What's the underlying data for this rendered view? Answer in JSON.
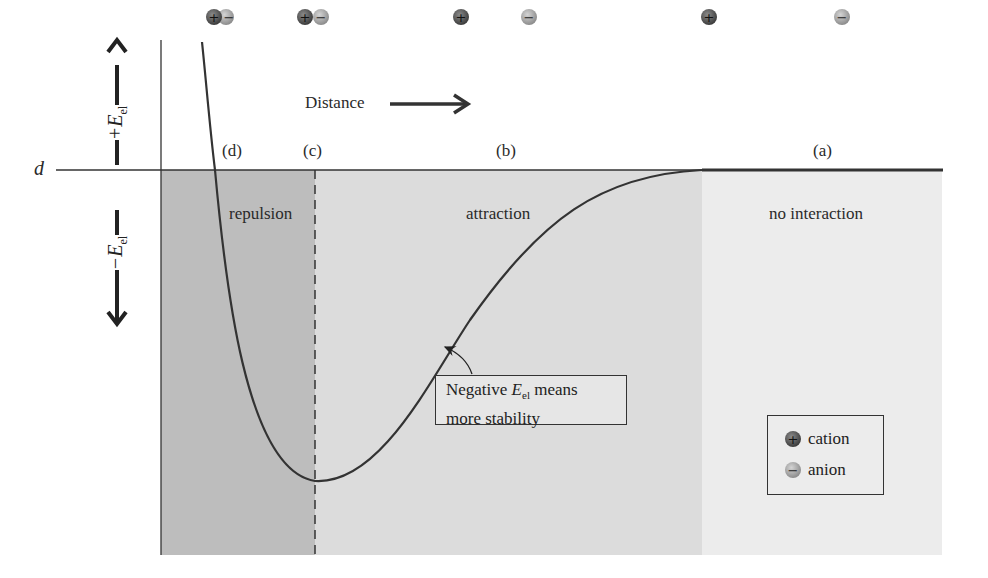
{
  "axes": {
    "y_positive_label": "+E",
    "y_positive_sub": "el",
    "y_negative_label": "−E",
    "y_negative_sub": "el",
    "baseline_label": "d",
    "x_direction_label": "Distance"
  },
  "stage_labels": {
    "d": "(d)",
    "c": "(c)",
    "b": "(b)",
    "a": "(a)"
  },
  "regions": [
    {
      "name": "repulsion",
      "label": "repulsion",
      "color": "#bdbdbd"
    },
    {
      "name": "attraction",
      "label": "attraction",
      "color": "#dcdcdc"
    },
    {
      "name": "no-interaction",
      "label": "no interaction",
      "color": "#ececec"
    }
  ],
  "callout": {
    "line1_prefix": "Negative ",
    "line1_var": "E",
    "line1_sub": "el",
    "line1_suffix": " means",
    "line2": "more stability"
  },
  "legend": {
    "cation_symbol": "+",
    "cation_label": "cation",
    "anion_symbol": "−",
    "anion_label": "anion"
  },
  "ion_pairs": [
    {
      "stage": "d",
      "cation": "+",
      "anion": "−",
      "separation": "overlapping"
    },
    {
      "stage": "c",
      "cation": "+",
      "anion": "−",
      "separation": "touching"
    },
    {
      "stage": "b",
      "cation": "+",
      "anion": "−",
      "separation": "medium"
    },
    {
      "stage": "a",
      "cation": "+",
      "anion": "−",
      "separation": "far"
    }
  ],
  "colors": {
    "cation": "#555555",
    "anion": "#a8a8a8",
    "curve": "#333333"
  }
}
